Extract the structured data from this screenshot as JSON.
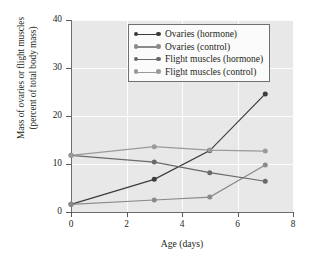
{
  "chart_data": {
    "type": "line",
    "title": "",
    "xlabel": "Age (days)",
    "ylabel": "Mass of ovaries or flight muscles (percent of total body mass)",
    "ylabel_line1": "Mass of ovaries or flight muscles",
    "ylabel_line2": "(percent of total body mass)",
    "x": [
      0,
      3,
      5,
      7
    ],
    "xlim": [
      0,
      8
    ],
    "ylim": [
      0,
      40
    ],
    "xticks": [
      0,
      2,
      4,
      6,
      8
    ],
    "yticks": [
      0,
      10,
      20,
      30,
      40
    ],
    "xtick_labels": [
      "0",
      "2",
      "4",
      "6",
      "8"
    ],
    "ytick_labels": [
      "0",
      "10",
      "20",
      "30",
      "40"
    ],
    "grid": true,
    "grid_color": "#fdfdfd",
    "plot_background": "#e8e8e8",
    "legend_position": "upper-center",
    "series": [
      {
        "name": "Ovaries (hormone)",
        "color": "#3c3c3e",
        "values": [
          1.6,
          6.8,
          12.8,
          24.6
        ]
      },
      {
        "name": "Ovaries (control)",
        "color": "#8a8a8c",
        "values": [
          1.6,
          2.5,
          3.1,
          9.8
        ]
      },
      {
        "name": "Flight muscles (hormone)",
        "color": "#6a6a6c",
        "values": [
          11.8,
          10.4,
          8.2,
          6.4
        ]
      },
      {
        "name": "Flight muscles (control)",
        "color": "#9a9a9c",
        "values": [
          11.8,
          13.6,
          12.9,
          12.7
        ]
      }
    ]
  }
}
